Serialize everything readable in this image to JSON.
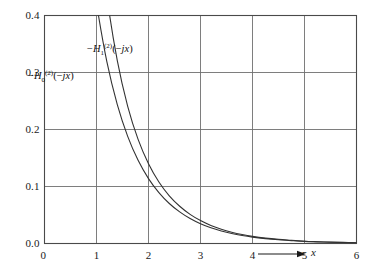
{
  "chart_data": {
    "type": "line",
    "title": "",
    "subtitle": "",
    "xlabel": "x",
    "ylabel": "",
    "xlim": [
      0,
      6
    ],
    "ylim": [
      0,
      0.4
    ],
    "grid": true,
    "legend_position": "inline-annotation",
    "xticks": [
      "0",
      "1",
      "2",
      "3",
      "4",
      "5",
      "6"
    ],
    "xtick_values": [
      0,
      1,
      2,
      3,
      4,
      5,
      6
    ],
    "yticks": [
      "0.0",
      "0.1",
      "0.2",
      "0.3",
      "0.4"
    ],
    "ytick_values": [
      0.0,
      0.1,
      0.2,
      0.3,
      0.4
    ],
    "x": [
      0.3,
      0.4,
      0.5,
      0.6,
      0.7,
      0.8,
      0.9,
      1.0,
      1.2,
      1.4,
      1.6,
      1.8,
      2.0,
      2.2,
      2.4,
      2.6,
      2.8,
      3.0,
      3.2,
      3.4,
      3.6,
      3.8,
      4.0,
      4.25,
      4.5,
      4.75,
      5.0,
      5.25,
      5.5,
      5.75,
      6.0
    ],
    "series": [
      {
        "name": "-H_0^(2)(-jx)",
        "label_text": "H",
        "label_sub": "0",
        "label_sup": "(2)",
        "label_prefix": "−",
        "label_arg": "(−jx)",
        "color": "#333333",
        "values": [
          1.3725,
          1.1145,
          0.9244,
          0.7775,
          0.6605,
          0.5653,
          0.4867,
          0.421,
          0.3185,
          0.2437,
          0.188,
          0.1459,
          0.1139,
          0.0893,
          0.0702,
          0.0554,
          0.0438,
          0.0347,
          0.0276,
          0.022,
          0.0175,
          0.014,
          0.0112,
          0.0086,
          0.0066,
          0.0051,
          0.0037,
          0.0029,
          0.0022,
          0.0017,
          0.0012
        ]
      },
      {
        "name": "-H_1^(2)(-jx)",
        "label_text": "H",
        "label_sub": "1",
        "label_sup": "(2)",
        "label_prefix": "−",
        "label_arg": "(−jx)",
        "color": "#333333",
        "values": [
          2.9931,
          2.1843,
          1.6564,
          1.3028,
          1.0503,
          0.8618,
          0.7165,
          0.6019,
          0.4346,
          0.3208,
          0.2406,
          0.1826,
          0.1399,
          0.1079,
          0.0837,
          0.0653,
          0.0511,
          0.0402,
          0.0316,
          0.025,
          0.0198,
          0.0157,
          0.0125,
          0.0095,
          0.0073,
          0.0056,
          0.004,
          0.0031,
          0.0024,
          0.0019,
          0.0013
        ]
      }
    ],
    "annotations": [
      {
        "id": "label-h1",
        "prefix": "−",
        "base": "H",
        "sub": "1",
        "sup": "(2)",
        "arg": "(−jx)",
        "x_px": 87,
        "y_px": 43
      },
      {
        "id": "label-h0",
        "prefix": "−",
        "base": "H",
        "sub": "0",
        "sup": "(2)",
        "arg": "(−jx)",
        "x_px": 28,
        "y_px": 70
      }
    ],
    "axis_arrow": {
      "label": "x",
      "x_px": 290,
      "y_px": 254
    },
    "origin_label": "0",
    "colors": {
      "curve": "#333333",
      "grid": "#6f6f6f",
      "frame": "#4a4a4a",
      "text": "#1a1a1a",
      "background": "#ffffff"
    }
  }
}
